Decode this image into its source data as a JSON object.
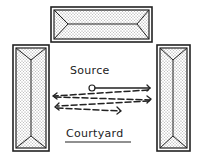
{
  "diagram": {
    "labels": {
      "source": "Source",
      "courtyard": "Courtyard"
    },
    "colors": {
      "ink": "#222222",
      "roof_fill": "#d8d8d8",
      "background": "#ffffff"
    },
    "buildings": [
      {
        "id": "top",
        "x": 51,
        "y": 7,
        "w": 101,
        "h": 35
      },
      {
        "id": "left",
        "x": 13,
        "y": 45,
        "w": 36,
        "h": 106
      },
      {
        "id": "right",
        "x": 157,
        "y": 45,
        "w": 33,
        "h": 106
      }
    ],
    "source_point": {
      "x": 92,
      "y": 88
    },
    "arrows": [
      {
        "name": "direct-sound",
        "style": "solid",
        "from": [
          95,
          88
        ],
        "to": [
          150,
          88
        ]
      },
      {
        "name": "reflection-1",
        "style": "dashed",
        "from": [
          148,
          90
        ],
        "to": [
          52,
          96
        ]
      },
      {
        "name": "reflection-2",
        "style": "dashed",
        "from": [
          55,
          97
        ],
        "to": [
          151,
          100
        ]
      },
      {
        "name": "reflection-3",
        "style": "dashed",
        "from": [
          149,
          102
        ],
        "to": [
          56,
          106
        ]
      },
      {
        "name": "reflection-4",
        "style": "dashed",
        "from": [
          57,
          108
        ],
        "to": [
          121,
          111
        ]
      }
    ]
  }
}
